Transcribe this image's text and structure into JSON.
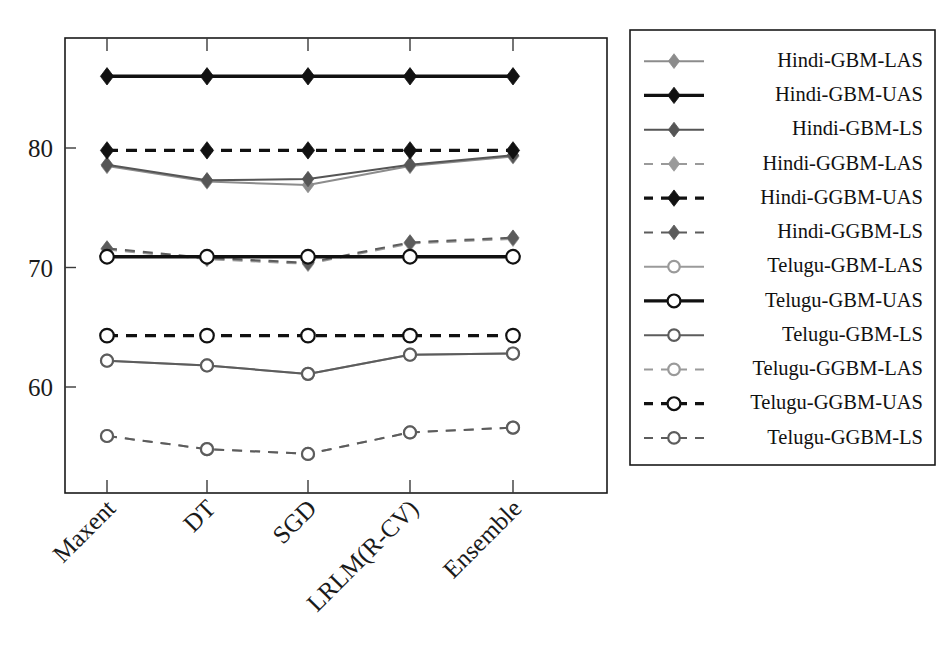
{
  "chart_data": {
    "type": "line",
    "title": "",
    "xlabel": "",
    "ylabel": "",
    "categories": [
      "Maxent",
      "DT",
      "SGD",
      "LRLM(R-CV)",
      "Ensemble"
    ],
    "ylim": [
      52.5,
      88.5
    ],
    "yticks": [
      60,
      70,
      80
    ],
    "ytick_labels": [
      "60",
      "70",
      "80"
    ],
    "grid": false,
    "legend_position": "right-outside",
    "series": [
      {
        "name": "Hindi-GBM-LAS",
        "values": [
          78.5,
          77.2,
          76.9,
          78.5,
          79.3
        ],
        "color": "#8c8c8c",
        "dash": "solid",
        "marker": "diamond-filled"
      },
      {
        "name": "Hindi-GBM-UAS",
        "values": [
          86.0,
          86.0,
          86.0,
          86.0,
          86.0
        ],
        "color": "#111111",
        "dash": "solid",
        "marker": "diamond-filled"
      },
      {
        "name": "Hindi-GBM-LS",
        "values": [
          78.6,
          77.3,
          77.4,
          78.6,
          79.4
        ],
        "color": "#555555",
        "dash": "solid",
        "marker": "diamond-filled"
      },
      {
        "name": "Hindi-GGBM-LAS",
        "values": [
          71.5,
          70.7,
          70.3,
          72.0,
          72.4
        ],
        "color": "#9a9a9a",
        "dash": "dashed",
        "marker": "diamond-filled"
      },
      {
        "name": "Hindi-GGBM-UAS",
        "values": [
          79.8,
          79.8,
          79.8,
          79.8,
          79.8
        ],
        "color": "#111111",
        "dash": "dashed",
        "marker": "diamond-filled"
      },
      {
        "name": "Hindi-GGBM-LS",
        "values": [
          71.6,
          70.8,
          70.4,
          72.1,
          72.5
        ],
        "color": "#5c5c5c",
        "dash": "dashed",
        "marker": "diamond-filled"
      },
      {
        "name": "Telugu-GBM-LAS",
        "values": [
          62.2,
          61.8,
          61.1,
          62.7,
          62.8
        ],
        "color": "#9a9a9a",
        "dash": "solid",
        "marker": "circle-open"
      },
      {
        "name": "Telugu-GBM-UAS",
        "values": [
          70.9,
          70.9,
          70.9,
          70.9,
          70.9
        ],
        "color": "#111111",
        "dash": "solid",
        "marker": "circle-open"
      },
      {
        "name": "Telugu-GBM-LS",
        "values": [
          62.2,
          61.8,
          61.1,
          62.7,
          62.8
        ],
        "color": "#5c5c5c",
        "dash": "solid",
        "marker": "circle-open"
      },
      {
        "name": "Telugu-GGBM-LAS",
        "values": [
          55.9,
          54.8,
          54.4,
          56.2,
          56.6
        ],
        "color": "#9a9a9a",
        "dash": "dashed",
        "marker": "circle-open"
      },
      {
        "name": "Telugu-GGBM-UAS",
        "values": [
          64.3,
          64.3,
          64.3,
          64.3,
          64.3
        ],
        "color": "#111111",
        "dash": "dashed",
        "marker": "circle-open"
      },
      {
        "name": "Telugu-GGBM-LS",
        "values": [
          55.9,
          54.8,
          54.4,
          56.2,
          56.6
        ],
        "color": "#5c5c5c",
        "dash": "dashed",
        "marker": "circle-open"
      }
    ]
  },
  "legend": {
    "entries": [
      "Hindi-GBM-LAS",
      "Hindi-GBM-UAS",
      "Hindi-GBM-LS",
      "Hindi-GGBM-LAS",
      "Hindi-GGBM-UAS",
      "Hindi-GGBM-LS",
      "Telugu-GBM-LAS",
      "Telugu-GBM-UAS",
      "Telugu-GBM-LS",
      "Telugu-GGBM-LAS",
      "Telugu-GGBM-UAS",
      "Telugu-GGBM-LS"
    ]
  },
  "axes": {
    "y_tick_labels": [
      "80",
      "70",
      "60"
    ],
    "x_tick_labels": [
      "Maxent",
      "DT",
      "SGD",
      "LRLM(R-CV)",
      "Ensemble"
    ]
  }
}
